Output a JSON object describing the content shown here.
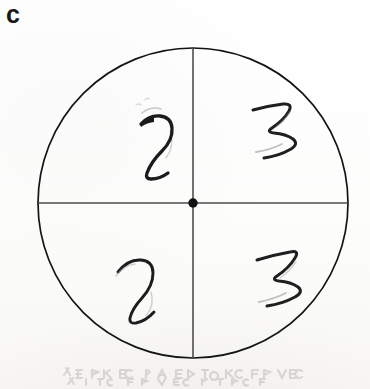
{
  "figure": {
    "panel_label": "c",
    "background_color": "#fdfdfc",
    "ink_color": "#1a1a1a",
    "line_color": "#333333"
  },
  "circle": {
    "center_x": 193,
    "center_y": 203,
    "radius": 155,
    "stroke_width": 1.6,
    "stroke_color": "#141414"
  },
  "center_dot": {
    "name": "center-dot",
    "x": 193,
    "y": 203,
    "radius": 4.6,
    "fill": "#111111"
  },
  "divider_lines": [
    {
      "name": "vertical-diameter",
      "orientation": "vertical",
      "x1": 193,
      "y1": 48,
      "x2": 193,
      "y2": 358,
      "stroke_width": 1.3,
      "stroke_color": "#3a3a3a"
    },
    {
      "name": "horizontal-diameter",
      "orientation": "horizontal",
      "x1": 38,
      "y1": 203,
      "x2": 348,
      "y2": 203,
      "stroke_width": 1.3,
      "stroke_color": "#4a4a4a"
    }
  ],
  "quadrant_marks": [
    {
      "name": "mark-upper-left",
      "quadrant": "upper-left",
      "digit": "2",
      "stroke_width": 3.4,
      "center_x": 157,
      "center_y": 128
    },
    {
      "name": "mark-upper-right",
      "quadrant": "upper-right",
      "digit": "3",
      "stroke_width": 3.1,
      "center_x": 279,
      "center_y": 128
    },
    {
      "name": "mark-lower-left",
      "quadrant": "lower-left",
      "digit": "2",
      "stroke_width": 2.9,
      "center_x": 142,
      "center_y": 288
    },
    {
      "name": "mark-lower-right",
      "quadrant": "lower-right",
      "digit": "3",
      "stroke_width": 3.1,
      "center_x": 283,
      "center_y": 277
    }
  ],
  "scan_artifact": {
    "name": "bleed-through-ghost-text",
    "visible": true,
    "description": "faint light-gray show-through of text from the reverse side of the page along the bottom edge"
  }
}
